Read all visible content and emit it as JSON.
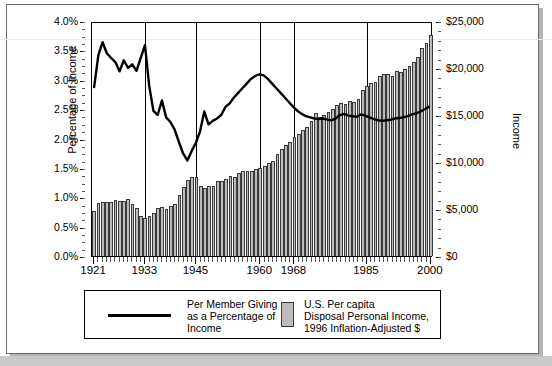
{
  "figure": {
    "left_axis_title": "Percentage of Income",
    "right_axis_title": "Income",
    "left_ticks": [
      "0.0%",
      "0.5%",
      "1.0%",
      "1.5%",
      "2.0%",
      "2.5%",
      "3.0%",
      "3.5%",
      "4.0%"
    ],
    "right_ticks": [
      "$0",
      "$5,000",
      "$10,000",
      "$15,000",
      "$20,000",
      "$25,000"
    ],
    "x_tick_labels": [
      "1921",
      "1933",
      "1945",
      "1960",
      "1968",
      "1985",
      "2000"
    ],
    "gridline_years": [
      1933,
      1945,
      1960,
      1968,
      1985,
      2000
    ],
    "legend": {
      "series_line_label_lines": [
        "Per Member Giving",
        "as a Percentage of",
        "Income"
      ],
      "series_bar_label_lines": [
        "U.S. Per capita",
        "Disposal Personal Income,",
        "1996 Inflation-Adjusted $"
      ]
    },
    "colors": {
      "bar_fill": "#bcbcbc",
      "bar_edge": "#3a3a3a",
      "line": "#000000",
      "frame": "#6a6a6a",
      "shadow": "#b4b4b4"
    }
  },
  "chart_data": {
    "type": "bar",
    "title": "",
    "subtitle": "",
    "xlabel": "",
    "ylabel": "Percentage of Income",
    "y2label": "Income",
    "ylim": [
      0,
      4.0
    ],
    "y2lim": [
      0,
      25000
    ],
    "grid": "vertical",
    "legend_position": "below-plot",
    "x": [
      1921,
      1922,
      1923,
      1924,
      1925,
      1926,
      1927,
      1928,
      1929,
      1930,
      1931,
      1932,
      1933,
      1934,
      1935,
      1936,
      1937,
      1938,
      1939,
      1940,
      1941,
      1942,
      1943,
      1944,
      1945,
      1946,
      1947,
      1948,
      1949,
      1950,
      1951,
      1952,
      1953,
      1954,
      1955,
      1956,
      1957,
      1958,
      1959,
      1960,
      1961,
      1962,
      1963,
      1964,
      1965,
      1966,
      1967,
      1968,
      1969,
      1970,
      1971,
      1972,
      1973,
      1974,
      1975,
      1976,
      1977,
      1978,
      1979,
      1980,
      1981,
      1982,
      1983,
      1984,
      1985,
      1986,
      1987,
      1988,
      1989,
      1990,
      1991,
      1992,
      1993,
      1994,
      1995,
      1996,
      1997,
      1998,
      1999,
      2000
    ],
    "series": [
      {
        "name": "U.S. Per capita Disposal Personal Income, 1996 Inflation-Adjusted $",
        "type": "bar",
        "axis": "right",
        "unit": "dollars",
        "values": [
          4750,
          5650,
          5700,
          5700,
          5750,
          5950,
          5850,
          5800,
          6050,
          5500,
          5150,
          4300,
          4000,
          4250,
          4550,
          5150,
          5200,
          4950,
          5350,
          5550,
          6450,
          7350,
          8050,
          8400,
          8400,
          7400,
          7250,
          7450,
          7450,
          7950,
          8000,
          8200,
          8500,
          8400,
          8800,
          9050,
          9050,
          9000,
          9300,
          9400,
          9550,
          9900,
          10150,
          10850,
          11400,
          11800,
          12100,
          12700,
          13000,
          13400,
          13700,
          14400,
          15200,
          14800,
          15000,
          15300,
          15600,
          16100,
          16300,
          16150,
          16450,
          16400,
          16700,
          17700,
          18100,
          18400,
          18500,
          19100,
          19350,
          19400,
          19200,
          19650,
          19600,
          19900,
          20250,
          20600,
          21150,
          22150,
          22700,
          23500
        ]
      },
      {
        "name": "Per Member Giving as a Percentage of Income",
        "type": "line",
        "axis": "left",
        "unit": "percent",
        "values": [
          2.9,
          3.45,
          3.67,
          3.48,
          3.4,
          3.33,
          3.17,
          3.36,
          3.23,
          3.29,
          3.18,
          3.4,
          3.62,
          2.92,
          2.49,
          2.42,
          2.67,
          2.38,
          2.3,
          2.17,
          1.96,
          1.76,
          1.64,
          1.8,
          1.94,
          2.14,
          2.48,
          2.26,
          2.32,
          2.36,
          2.42,
          2.56,
          2.62,
          2.72,
          2.8,
          2.88,
          2.96,
          3.04,
          3.09,
          3.12,
          3.1,
          3.04,
          2.96,
          2.88,
          2.8,
          2.72,
          2.64,
          2.56,
          2.49,
          2.44,
          2.4,
          2.38,
          2.36,
          2.35,
          2.36,
          2.34,
          2.33,
          2.36,
          2.42,
          2.44,
          2.41,
          2.4,
          2.39,
          2.43,
          2.41,
          2.38,
          2.35,
          2.33,
          2.32,
          2.33,
          2.34,
          2.36,
          2.37,
          2.38,
          2.4,
          2.43,
          2.45,
          2.48,
          2.52,
          2.56
        ]
      }
    ]
  }
}
